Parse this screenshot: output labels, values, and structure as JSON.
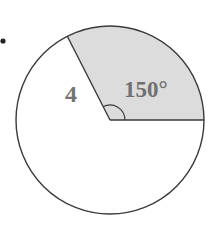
{
  "figure": {
    "type": "circle-sector",
    "radius_label": "4",
    "angle_label": "150°",
    "angle_degrees": 150,
    "colors": {
      "background": "#ffffff",
      "sector_fill": "#dcdcdc",
      "outline": "#3a3a3a",
      "label_text": "#737373",
      "bullet": "#222222"
    }
  }
}
